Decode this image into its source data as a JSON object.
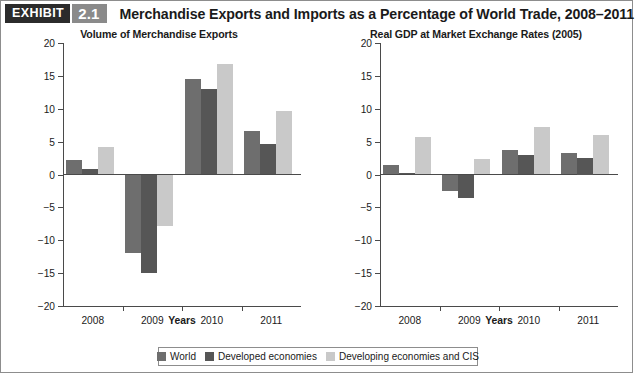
{
  "header": {
    "exhibit_tag": "EXHIBIT",
    "exhibit_number": "2.1",
    "title": "Merchandise Exports and Imports as a Percentage of World Trade, 2008–2011",
    "tag_color": "#2b2b2b",
    "number_color": "#8a8a8a"
  },
  "legend": {
    "entries": [
      {
        "label": "World",
        "color": "#6e6e6e"
      },
      {
        "label": "Developed economies",
        "color": "#565656"
      },
      {
        "label": "Developing economies and CIS",
        "color": "#c9c9c9"
      }
    ]
  },
  "chart_data": [
    {
      "type": "bar",
      "id": "volume-of-merchandise-exports",
      "title": "Volume of Merchandise Exports",
      "xlabel": "Years",
      "ylabel": "",
      "categories": [
        "2008",
        "2009",
        "2010",
        "2011"
      ],
      "ylim": [
        -20,
        20
      ],
      "yticks": [
        20,
        15,
        10,
        5,
        0,
        -5,
        -10,
        -15,
        -20
      ],
      "ytick_labels": [
        "20",
        "15",
        "10",
        "5",
        "0",
        "−5",
        "−10",
        "−15",
        "−20"
      ],
      "grid": false,
      "legend_position": "bottom",
      "series": [
        {
          "name": "World",
          "color": "#6e6e6e",
          "values": [
            2.2,
            -12.0,
            14.6,
            6.6
          ]
        },
        {
          "name": "Developed economies",
          "color": "#565656",
          "values": [
            0.8,
            -15.0,
            13.0,
            4.7
          ]
        },
        {
          "name": "Developing economies and CIS",
          "color": "#c9c9c9",
          "values": [
            4.2,
            -7.9,
            16.8,
            9.7
          ]
        }
      ]
    },
    {
      "type": "bar",
      "id": "real-gdp-at-market-exchange-rates",
      "title": "Real GDP at Market Exchange Rates (2005)",
      "xlabel": "Years",
      "ylabel": "",
      "categories": [
        "2008",
        "2009",
        "2010",
        "2011"
      ],
      "ylim": [
        -20,
        20
      ],
      "yticks": [
        20,
        15,
        10,
        5,
        0,
        -5,
        -10,
        -15,
        -20
      ],
      "ytick_labels": [
        "20",
        "15",
        "10",
        "5",
        "0",
        "−5",
        "−10",
        "−15",
        "−20"
      ],
      "grid": false,
      "legend_position": "bottom",
      "series": [
        {
          "name": "World",
          "color": "#6e6e6e",
          "values": [
            1.5,
            -2.5,
            3.8,
            3.3
          ]
        },
        {
          "name": "Developed economies",
          "color": "#565656",
          "values": [
            0.3,
            -3.5,
            2.9,
            2.5
          ]
        },
        {
          "name": "Developing economies and CIS",
          "color": "#c9c9c9",
          "values": [
            5.7,
            2.3,
            7.2,
            6.0
          ]
        }
      ]
    }
  ]
}
